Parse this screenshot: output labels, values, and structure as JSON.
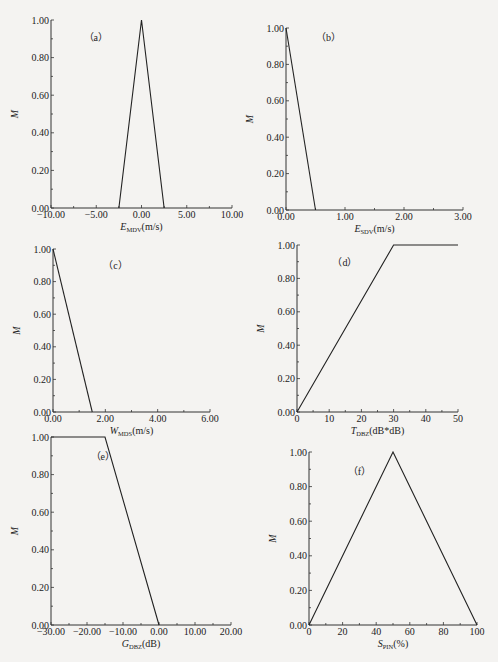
{
  "chart_data": [
    {
      "id": "a",
      "type": "line",
      "panel_label": "（a）",
      "xlabel": {
        "main": "E",
        "sub": "MDV",
        "unit": "(m/s)"
      },
      "ylabel": "M",
      "xlim": [
        -10,
        10
      ],
      "ylim": [
        0,
        1
      ],
      "xticks": [
        -10,
        -5,
        0,
        5,
        10
      ],
      "xtick_labels": [
        "−10.00",
        "−5.00",
        "0.00",
        "5.00",
        "10.00"
      ],
      "yticks": [
        0,
        0.2,
        0.4,
        0.6,
        0.8,
        1.0
      ],
      "ytick_labels": [
        "0.00",
        "0.20",
        "0.40",
        "0.60",
        "0.80",
        "1.00"
      ],
      "x": [
        -2.5,
        0,
        2.5
      ],
      "y": [
        0,
        1,
        0
      ]
    },
    {
      "id": "b",
      "type": "line",
      "panel_label": "（b）",
      "xlabel": {
        "main": "E",
        "sub": "SDV",
        "unit": "(m/s)"
      },
      "ylabel": "M",
      "xlim": [
        0,
        3
      ],
      "ylim": [
        0,
        1
      ],
      "xticks": [
        0,
        1,
        2,
        3
      ],
      "xtick_labels": [
        "0.00",
        "1.00",
        "2.00",
        "3.00"
      ],
      "yticks": [
        0,
        0.2,
        0.4,
        0.6,
        0.8,
        1.0
      ],
      "ytick_labels": [
        "0.00",
        "0.20",
        "0.40",
        "0.60",
        "0.80",
        "1.00"
      ],
      "x": [
        0,
        0.5
      ],
      "y": [
        1,
        0
      ]
    },
    {
      "id": "c",
      "type": "line",
      "panel_label": "（c）",
      "xlabel": {
        "main": "W",
        "sub": "MDS",
        "unit": "(m/s)"
      },
      "ylabel": "M",
      "xlim": [
        0,
        6
      ],
      "ylim": [
        0,
        1
      ],
      "xticks": [
        0,
        2,
        4,
        6
      ],
      "xtick_labels": [
        "0.00",
        "2.00",
        "4.00",
        "6.00"
      ],
      "yticks": [
        0,
        0.2,
        0.4,
        0.6,
        0.8,
        1.0
      ],
      "ytick_labels": [
        "0.00",
        "0.20",
        "0.40",
        "0.60",
        "0.80",
        "1.00"
      ],
      "x": [
        0,
        1.5
      ],
      "y": [
        1,
        0
      ]
    },
    {
      "id": "d",
      "type": "line",
      "panel_label": "（d）",
      "xlabel": {
        "main": "T",
        "sub": "DBZ",
        "unit": "(dB*dB)"
      },
      "ylabel": "M",
      "xlim": [
        0,
        50
      ],
      "ylim": [
        0,
        1
      ],
      "xticks": [
        0,
        10,
        20,
        30,
        40,
        50
      ],
      "xtick_labels": [
        "0",
        "10",
        "20",
        "30",
        "40",
        "50"
      ],
      "yticks": [
        0,
        0.2,
        0.4,
        0.6,
        0.8,
        1.0
      ],
      "ytick_labels": [
        "0.00",
        "0.20",
        "0.40",
        "0.60",
        "0.80",
        "1.00"
      ],
      "x": [
        0,
        30,
        50
      ],
      "y": [
        0,
        1,
        1
      ]
    },
    {
      "id": "e",
      "type": "line",
      "panel_label": "（e）",
      "xlabel": {
        "main": "G",
        "sub": "DBZ",
        "unit": "(dB)"
      },
      "ylabel": "M",
      "xlim": [
        -30,
        20
      ],
      "ylim": [
        0,
        1
      ],
      "xticks": [
        -30,
        -20,
        -10,
        0,
        10,
        20
      ],
      "xtick_labels": [
        "−30.00",
        "−20.00",
        "−10.00",
        "0.00",
        "10.00",
        "20.00"
      ],
      "yticks": [
        0,
        0.2,
        0.4,
        0.6,
        0.8,
        1.0
      ],
      "ytick_labels": [
        "0.00",
        "0.20",
        "0.40",
        "0.60",
        "0.80",
        "1.00"
      ],
      "x": [
        -30,
        -15,
        0
      ],
      "y": [
        1,
        1,
        0
      ]
    },
    {
      "id": "f",
      "type": "line",
      "panel_label": "（f）",
      "xlabel": {
        "main": "S",
        "sub": "PIN",
        "unit": "(%)"
      },
      "ylabel": "M",
      "xlim": [
        0,
        100
      ],
      "ylim": [
        0,
        1
      ],
      "xticks": [
        0,
        20,
        40,
        60,
        80,
        100
      ],
      "xtick_labels": [
        "0",
        "20",
        "40",
        "60",
        "80",
        "100"
      ],
      "yticks": [
        0,
        0.2,
        0.4,
        0.6,
        0.8,
        1.0
      ],
      "ytick_labels": [
        "0.00",
        "0.20",
        "0.40",
        "0.60",
        "0.80",
        "1.00"
      ],
      "x": [
        0,
        50,
        100
      ],
      "y": [
        0,
        1,
        0
      ]
    }
  ]
}
